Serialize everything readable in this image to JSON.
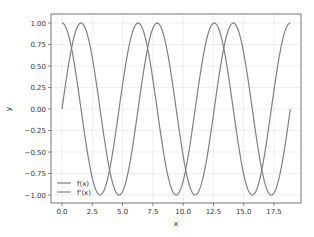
{
  "chart_data": {
    "type": "line",
    "title": "",
    "xlabel": "x",
    "ylabel": "y",
    "xlim": [
      -0.94,
      19.79
    ],
    "ylim": [
      -1.1,
      1.1
    ],
    "grid": true,
    "legend_position": "lower left",
    "xticks": [
      "0.0",
      "2.5",
      "5.0",
      "7.5",
      "10.0",
      "12.5",
      "15.0",
      "17.5"
    ],
    "yticks": [
      "1.00",
      "0.75",
      "0.50",
      "0.25",
      "0.00",
      "-0.25",
      "-0.50",
      "-0.75",
      "-1.00"
    ],
    "x_range": [
      0,
      18.85
    ],
    "series": [
      {
        "name": "f(x)",
        "function": "sin(x)",
        "color": "#808080",
        "start": [
          0,
          0
        ],
        "end": [
          18.85,
          0
        ]
      },
      {
        "name": "f'(x)",
        "function": "cos(x)",
        "color": "#808080",
        "start": [
          0,
          1
        ],
        "end": [
          18.85,
          1
        ]
      }
    ]
  },
  "legend": {
    "items": [
      {
        "label": "f(x)"
      },
      {
        "label": "f'(x)"
      }
    ]
  },
  "colors": {
    "line": "#808080",
    "grid": "#e6e6e6",
    "frame": "#555555"
  }
}
